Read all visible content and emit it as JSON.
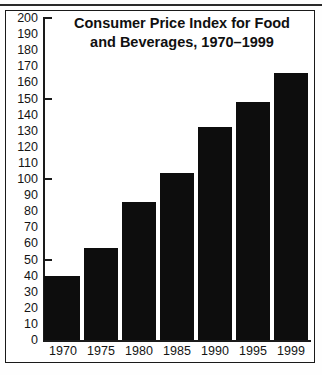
{
  "figure": {
    "title_line1": "Consumer Price Index for Food",
    "title_line2": "and Beverages, 1970–1999",
    "title_full": "Consumer Price Index for Food and Beverages, 1970–1999",
    "frame_color": "#1a1a1a",
    "bar_color": "#0d0d0d",
    "background_color": "#ffffff"
  },
  "chart_data": {
    "type": "bar",
    "title": "Consumer Price Index for Food and Beverages, 1970–1999",
    "xlabel": "",
    "ylabel": "",
    "categories": [
      "1970",
      "1975",
      "1980",
      "1985",
      "1990",
      "1995",
      "1999"
    ],
    "values": [
      40,
      57,
      86,
      104,
      132,
      148,
      166
    ],
    "ylim": [
      0,
      200
    ],
    "ytick_step": 10,
    "yticks": [
      0,
      10,
      20,
      30,
      40,
      50,
      60,
      70,
      80,
      90,
      100,
      110,
      120,
      130,
      140,
      150,
      160,
      170,
      180,
      190,
      200
    ],
    "ytick_labels": [
      "0",
      "10",
      "20",
      "30",
      "40",
      "50",
      "60",
      "70",
      "80",
      "90",
      "100",
      "110",
      "120",
      "130",
      "140",
      "150",
      "160",
      "170",
      "180",
      "190",
      "200"
    ],
    "major_yticks": [
      50,
      100,
      150,
      200
    ],
    "grid": false,
    "legend": null,
    "series": [
      {
        "name": "Consumer Price Index",
        "values": [
          40,
          57,
          86,
          104,
          132,
          148,
          166
        ]
      }
    ]
  }
}
